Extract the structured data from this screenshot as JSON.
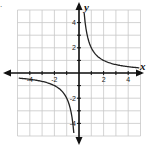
{
  "problem_marker": ".",
  "graph": {
    "title": "",
    "x_axis_label": "x",
    "y_axis_label": "y",
    "x_range": [
      -5,
      5
    ],
    "y_range": [
      -5,
      5
    ],
    "grid": true,
    "x_tick_labels": [
      "-4",
      "-2",
      "2",
      "4"
    ],
    "y_tick_labels": [
      "4",
      "2",
      "-2",
      "-4"
    ],
    "curve_description": "Hyperbola y = 2/x with branches in quadrants I and III",
    "colors": {
      "grid": "#c8c8c8",
      "axis": "#111111",
      "curve": "#222222"
    }
  },
  "chart_data": {
    "type": "line",
    "title": "",
    "xlabel": "x",
    "ylabel": "y",
    "xlim": [
      -5,
      5
    ],
    "ylim": [
      -5,
      5
    ],
    "grid": true,
    "x_ticks": [
      -4,
      -2,
      2,
      4
    ],
    "y_ticks": [
      -4,
      -2,
      2,
      4
    ],
    "series": [
      {
        "name": "branch-quadrant-I",
        "x": [
          0.4,
          0.5,
          1,
          2,
          3,
          4,
          5
        ],
        "y": [
          5,
          4,
          2,
          1,
          0.67,
          0.5,
          0.4
        ]
      },
      {
        "name": "branch-quadrant-III",
        "x": [
          -5,
          -4,
          -3,
          -2,
          -1,
          -0.5,
          -0.4
        ],
        "y": [
          -0.4,
          -0.5,
          -0.67,
          -1,
          -2,
          -4,
          -5
        ]
      }
    ]
  }
}
